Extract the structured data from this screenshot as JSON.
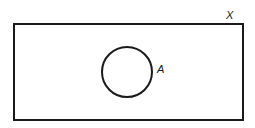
{
  "diagram": {
    "type": "venn",
    "universal_set": {
      "label": "X"
    },
    "sets": [
      {
        "label": "A"
      }
    ],
    "colors": {
      "stroke": "#1a1a1a",
      "background": "#ffffff"
    }
  }
}
